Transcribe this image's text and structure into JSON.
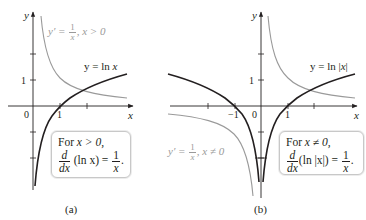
{
  "panel_a": {
    "caption": "(a)",
    "axis_x": "x",
    "axis_y": "y",
    "tick_origin": "0",
    "tick_x1": "1",
    "tick_y1": "1",
    "curve_label_prefix": "y = ln ",
    "curve_label_var": "x",
    "derivative_label": {
      "lhs": "y′ =",
      "num": "1",
      "den": "x",
      "cond": ", x > 0"
    },
    "box": {
      "line1_prefix": "For ",
      "line1_cond": "x > 0,",
      "frac_num": "d",
      "frac_den": "dx",
      "expr": "(ln x) =",
      "rhs_num": "1",
      "rhs_den": "x",
      "end": "."
    }
  },
  "panel_b": {
    "caption": "(b)",
    "axis_x": "x",
    "axis_y": "y",
    "tick_origin": "0",
    "tick_x1": "1",
    "tick_xm1": "−1",
    "tick_y1": "1",
    "curve_label_prefix": "y = ln |",
    "curve_label_var": "x",
    "curve_label_suffix": "|",
    "derivative_label": {
      "lhs": "y′ =",
      "num": "1",
      "den": "x",
      "cond": ", x ≠ 0"
    },
    "box": {
      "line1_prefix": "For ",
      "line1_cond": "x ≠ 0,",
      "frac_num": "d",
      "frac_den": "dx",
      "expr": "(ln |x|) =",
      "rhs_num": "1",
      "rhs_den": "x",
      "end": "."
    }
  },
  "colors": {
    "curve_dark": "#231f20",
    "curve_light": "#9a9a9a",
    "axis": "#231f20",
    "box_border": "#c8c8c8"
  }
}
